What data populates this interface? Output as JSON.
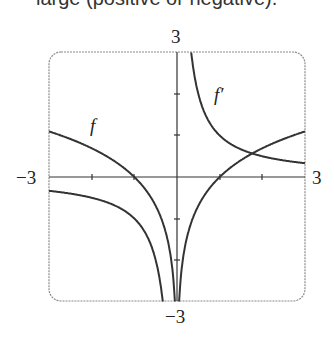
{
  "header": {
    "cropped_text": "large (positive or negative)."
  },
  "chart_data": {
    "type": "line",
    "title": "",
    "xlabel": "",
    "ylabel": "",
    "xlim": [
      -3,
      3
    ],
    "ylim": [
      -3,
      3
    ],
    "tick_labels": {
      "x_min": "−3",
      "x_max": "3",
      "y_min": "−3",
      "y_max": "3"
    },
    "grid": false,
    "series": [
      {
        "name": "f",
        "formula": "ln|x|",
        "x": [
          -3,
          -2,
          -1,
          -0.5,
          -0.1,
          0.1,
          0.5,
          1,
          2,
          3
        ],
        "values": [
          1.1,
          0.69,
          0,
          -0.69,
          -2.3,
          -2.3,
          -0.69,
          0,
          0.69,
          1.1
        ]
      },
      {
        "name": "f′",
        "formula": "1/x",
        "x": [
          -3,
          -2,
          -1,
          -0.5,
          -0.34,
          0.34,
          0.5,
          1,
          2,
          3
        ],
        "values": [
          -0.33,
          -0.5,
          -1,
          -2,
          -3,
          3,
          2,
          1,
          0.5,
          0.33
        ]
      }
    ],
    "annotations": [
      "f",
      "f′"
    ],
    "colors": {
      "curve": "#333333",
      "axis": "#333333",
      "frame": "#888888"
    }
  }
}
